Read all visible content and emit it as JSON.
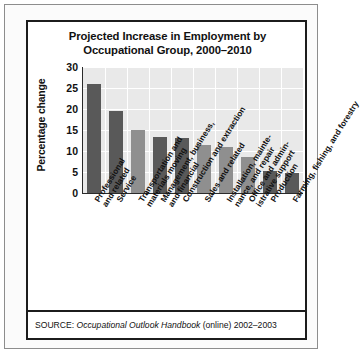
{
  "figure": {
    "title": "Projected Increase in Employment by Occupational Group, 2000–2010",
    "source_prefix": "SOURCE:",
    "source_title": "Occupational Outlook Handbook",
    "source_suffix": "(online) 2002–2003"
  },
  "colors": {
    "bar_dark": "#595959",
    "bar_light": "#8f8f8f",
    "plot_background": "#e9e9e9",
    "gridline": "#ffffff",
    "axis": "#2a2a2a",
    "frame": "#1c1c1c"
  },
  "chart_data": {
    "type": "bar",
    "title": "Projected Increase in Employment by Occupational Group, 2000–2010",
    "xlabel": "",
    "ylabel": "Percentage change",
    "ylim": [
      0,
      30
    ],
    "yticks": [
      0,
      5,
      10,
      15,
      20,
      25,
      30
    ],
    "grid": true,
    "legend": "none",
    "categories": [
      "Professional\nand related",
      "Service",
      "Transportation and\nmaterials moving",
      "Management, business,\nand financial",
      "Construction and extraction",
      "Sales and related",
      "Installation, mainte-\nnance, and repair",
      "Office and admin-\nistrative support",
      "Production",
      "Farming, fishing, and forestry"
    ],
    "values": [
      26,
      19.5,
      15,
      13.3,
      13,
      11.5,
      11,
      8.5,
      5.2,
      4.8
    ],
    "bar_shades": [
      "dark",
      "dark",
      "light",
      "dark",
      "dark",
      "light",
      "light",
      "light",
      "dark",
      "dark"
    ]
  }
}
